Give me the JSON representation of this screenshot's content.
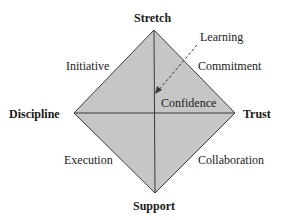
{
  "diagram": {
    "colors": {
      "fill": "#c6c6c6",
      "stroke": "#3a3a3a",
      "text": "#1a1a1a"
    },
    "poles": {
      "top": "Stretch",
      "left": "Discipline",
      "right": "Trust",
      "bottom": "Support"
    },
    "edges": {
      "top_left": "Initiative",
      "top_right": "Commitment",
      "bottom_left": "Execution",
      "bottom_right": "Collaboration"
    },
    "center": "Confidence",
    "arrow_label": "Learning"
  }
}
